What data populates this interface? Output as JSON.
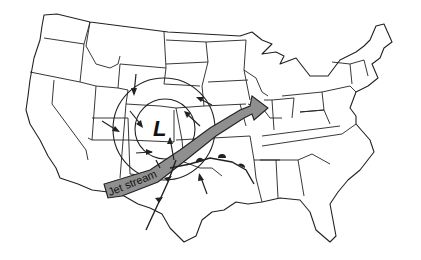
{
  "diagram": {
    "type": "weather map",
    "region": "Contiguous United States",
    "low_pressure": {
      "label": "L"
    },
    "jet_stream": {
      "label": "Jet stream",
      "fill_color": "#8f8f8f"
    },
    "isobars": {
      "count": 2
    },
    "elements": [
      "state boundaries",
      "concentric isobars around low",
      "wind arrows converging counterclockwise",
      "shaded jet stream arrow from southwest to northeast",
      "warm front extending east",
      "cold front extending southwest"
    ]
  }
}
